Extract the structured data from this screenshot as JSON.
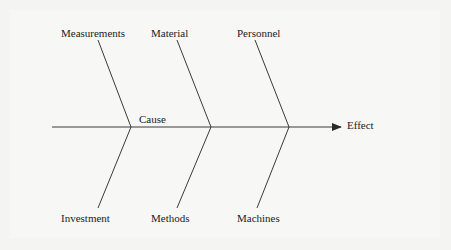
{
  "diagram": {
    "type": "fishbone",
    "spine_label": "Cause",
    "effect_label": "Effect",
    "top_categories": [
      {
        "label": "Measurements"
      },
      {
        "label": "Material"
      },
      {
        "label": "Personnel"
      }
    ],
    "bottom_categories": [
      {
        "label": "Investment"
      },
      {
        "label": "Methods"
      },
      {
        "label": "Machines"
      }
    ],
    "colors": {
      "line": "#3a3a3a",
      "text": "#222222",
      "background": "#f5f5f4"
    }
  }
}
